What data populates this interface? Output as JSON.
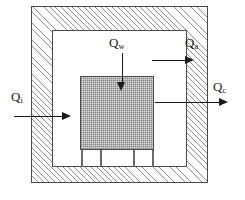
{
  "figure": {
    "type": "heat-flow-schematic",
    "width": 245,
    "height": 200,
    "background_color": "#ffffff",
    "line_color": "#1a1a1a"
  },
  "regions": {
    "enclosure": {
      "name": "outer-enclosure-wall",
      "fill": "diagonal-hatch",
      "hatch_color": "#8d8d8d",
      "border_color": "#4a4a4a"
    },
    "chamber": {
      "name": "inner-air-chamber",
      "fill": "white",
      "fill_color": "#ffffff",
      "border_color": "#4a4a4a"
    },
    "block": {
      "name": "central-shaded-block",
      "fill": "fine-dotted-grid",
      "fill_color": "#e3e3e3",
      "border_color": "#4a4a4a"
    },
    "supports": {
      "name": "support-legs",
      "count": 4,
      "color": "#6a6a6a"
    }
  },
  "flows": [
    {
      "key": "qi",
      "symbol": "Q",
      "subscript": "i",
      "label": "Qi",
      "direction": "right",
      "position": "left-wall",
      "description": "heat entering through the left enclosure wall"
    },
    {
      "key": "qa",
      "symbol": "Q",
      "subscript": "a",
      "label": "Qa",
      "direction": "right",
      "position": "upper-right-wall",
      "description": "heat entering the right enclosure wall"
    },
    {
      "key": "qc",
      "symbol": "Q",
      "subscript": "c",
      "label": "Qc",
      "direction": "right",
      "position": "right-exit",
      "description": "heat leaving to the right through the wall"
    },
    {
      "key": "qw",
      "symbol": "Q",
      "subscript": "w",
      "label": "Qw",
      "direction": "down",
      "position": "top-center",
      "description": "heat descending into the central block"
    }
  ]
}
